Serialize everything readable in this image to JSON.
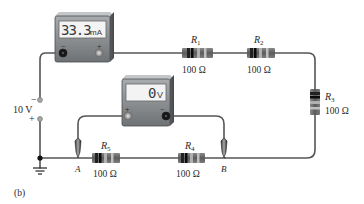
{
  "figure_label": "(b)",
  "source": {
    "voltage_label": "10 V",
    "minus_label": "−",
    "plus_label": "+"
  },
  "ammeter": {
    "reading": "33.3",
    "unit": "mA",
    "minus_label": "−",
    "plus_label": "+"
  },
  "voltmeter": {
    "reading": "0",
    "unit": "V",
    "minus_label": "−",
    "plus_label": "+"
  },
  "resistors": [
    {
      "id": "R1",
      "name": "R",
      "sub": "1",
      "value": "100 Ω"
    },
    {
      "id": "R2",
      "name": "R",
      "sub": "2",
      "value": "100 Ω"
    },
    {
      "id": "R3",
      "name": "R",
      "sub": "3",
      "value": "100 Ω"
    },
    {
      "id": "R4",
      "name": "R",
      "sub": "4",
      "value": "100 Ω"
    },
    {
      "id": "R5",
      "name": "R",
      "sub": "5",
      "value": "100 Ω"
    }
  ],
  "nodes": {
    "A": "A",
    "B": "B"
  },
  "colors": {
    "wire": "#555555",
    "meter_body": "#8a8d8f",
    "meter_face": "#f2f2f2",
    "resistor_body": "#6f6f6f",
    "band_dark": "#111111",
    "band_light": "#b8b8b8"
  }
}
